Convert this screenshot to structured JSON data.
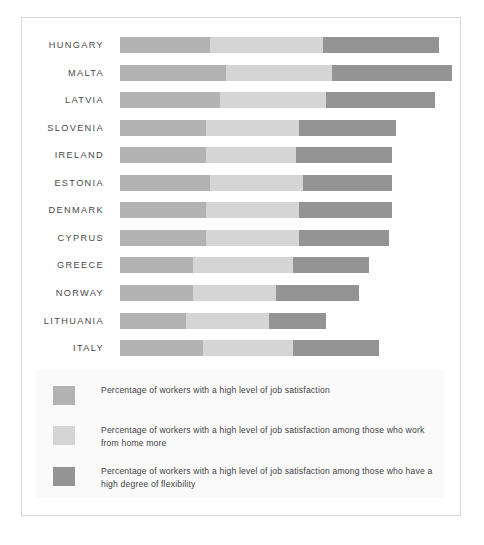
{
  "chart_data": {
    "type": "bar",
    "orientation": "horizontal",
    "stacked": true,
    "title": "",
    "subtitle": "",
    "xlabel": "",
    "ylabel": "",
    "grid": false,
    "xlim": [
      0,
      100
    ],
    "legend_position": "bottom",
    "categories": [
      "HUNGARY",
      "MALTA",
      "LATVIA",
      "SLOVENIA",
      "IRELAND",
      "ESTONIA",
      "DENMARK",
      "CYPRUS",
      "GREECE",
      "NORWAY",
      "LITHUANIA",
      "ITALY"
    ],
    "series": [
      {
        "name": "Percentage of workers with a high level of job satisfaction",
        "key": "base",
        "color": "#b3b3b3",
        "values": [
          27,
          32,
          30,
          26,
          26,
          27,
          26,
          26,
          22,
          22,
          20,
          25
        ]
      },
      {
        "name": "Percentage of workers with a high level of job satisfaction among those who work from home more",
        "key": "work_from_home",
        "color": "#d5d5d5",
        "values": [
          34,
          32,
          32,
          28,
          27,
          28,
          28,
          28,
          30,
          25,
          25,
          27
        ]
      },
      {
        "name": "Percentage of workers with a high level of job satisfaction among those who have a high degree of flexibility",
        "key": "high_flexibility",
        "color": "#949494",
        "values": [
          35,
          36,
          33,
          29,
          29,
          27,
          28,
          27,
          23,
          25,
          17,
          26
        ]
      }
    ],
    "totals": [
      96,
      100,
      95,
      83,
      82,
      82,
      82,
      81,
      75,
      72,
      62,
      78
    ]
  },
  "legend": {
    "items": [
      {
        "swatch_color": "#b3b3b3",
        "label": "Percentage of workers with a high level of job satisfaction"
      },
      {
        "swatch_color": "#d5d5d5",
        "label": "Percentage of workers with a high level of job satisfaction among those who work from home more"
      },
      {
        "swatch_color": "#949494",
        "label": "Percentage of workers with a high level of job satisfaction among those who have a high degree of flexibility"
      }
    ]
  },
  "style": {
    "frame_border_color": "#d8d8d8",
    "page_background": "#ffffff",
    "legend_background": "#fafafa",
    "label_color": "#4a4a4a"
  }
}
